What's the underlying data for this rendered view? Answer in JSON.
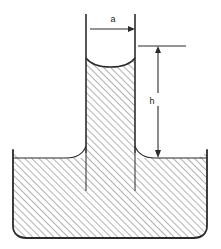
{
  "figure": {
    "background_color": "#ffffff",
    "line_color": "#2b2b2b",
    "hatch_color": "#555555",
    "labels": {
      "radius": "a",
      "height": "h"
    },
    "geometry": {
      "tube_left_x": 86,
      "tube_right_x": 135,
      "tube_top_y": 14,
      "meniscus_bottom_y": 58,
      "reservoir_left_x": 13,
      "reservoir_right_x": 207,
      "reservoir_top_y": 150,
      "liquid_surface_y": 158,
      "reservoir_bottom_y": 238,
      "corner_radius": 12
    },
    "dimensions": {
      "radius_arrow": {
        "label": "a",
        "label_x": 113,
        "label_y": 19,
        "arrow_from_x": 90,
        "arrow_to_x": 134,
        "arrow_y": 29
      },
      "height_arrow": {
        "label": "h",
        "label_x": 152,
        "label_y": 103,
        "arrow_x": 158,
        "arrow_top_y": 47,
        "arrow_bottom_y": 157,
        "tick_left_x": 138,
        "tick_right_x": 186,
        "tick_y": 46
      }
    }
  }
}
